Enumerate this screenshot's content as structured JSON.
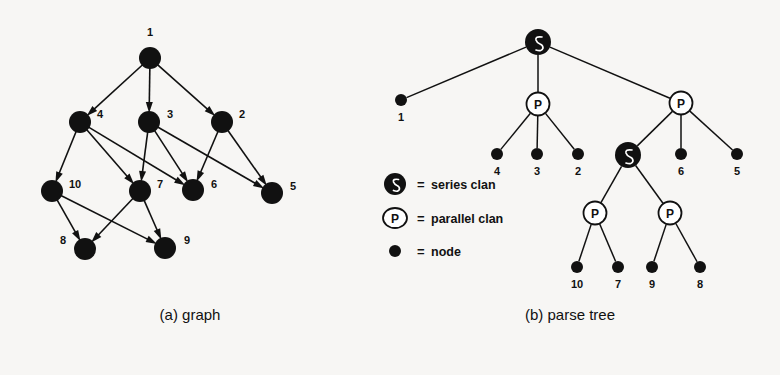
{
  "figure": {
    "background_color": "#f7f6f4",
    "ink_color": "#111111",
    "panels": [
      {
        "id": "a",
        "caption": "(a) graph"
      },
      {
        "id": "b",
        "caption": "(b) parse tree"
      }
    ]
  },
  "chart_data": {
    "type": "diagram",
    "panel_a": {
      "caption": "(a) graph",
      "kind": "directed-graph",
      "nodes": [
        {
          "id": "1",
          "label": "1",
          "x": 150,
          "y": 58,
          "label_x": 150,
          "label_y": 36,
          "label_anchor": "middle"
        },
        {
          "id": "4",
          "label": "4",
          "x": 80,
          "y": 122,
          "label_x": 97,
          "label_y": 118,
          "label_anchor": "start"
        },
        {
          "id": "3",
          "label": "3",
          "x": 149,
          "y": 122,
          "label_x": 167,
          "label_y": 118,
          "label_anchor": "start"
        },
        {
          "id": "2",
          "label": "2",
          "x": 222,
          "y": 122,
          "label_x": 239,
          "label_y": 118,
          "label_anchor": "start"
        },
        {
          "id": "10",
          "label": "10",
          "x": 52,
          "y": 191,
          "label_x": 69,
          "label_y": 188,
          "label_anchor": "start"
        },
        {
          "id": "7",
          "label": "7",
          "x": 140,
          "y": 191,
          "label_x": 157,
          "label_y": 188,
          "label_anchor": "start"
        },
        {
          "id": "6",
          "label": "6",
          "x": 193,
          "y": 190,
          "label_x": 211,
          "label_y": 188,
          "label_anchor": "start"
        },
        {
          "id": "5",
          "label": "5",
          "x": 272,
          "y": 193,
          "label_x": 290,
          "label_y": 190,
          "label_anchor": "start"
        },
        {
          "id": "8",
          "label": "8",
          "x": 85,
          "y": 249,
          "label_x": 66,
          "label_y": 244,
          "label_anchor": "end"
        },
        {
          "id": "9",
          "label": "9",
          "x": 165,
          "y": 248,
          "label_x": 184,
          "label_y": 244,
          "label_anchor": "start"
        }
      ],
      "edges": [
        {
          "from": "1",
          "to": "4"
        },
        {
          "from": "1",
          "to": "3"
        },
        {
          "from": "1",
          "to": "2"
        },
        {
          "from": "4",
          "to": "10"
        },
        {
          "from": "4",
          "to": "7"
        },
        {
          "from": "4",
          "to": "6"
        },
        {
          "from": "3",
          "to": "7"
        },
        {
          "from": "3",
          "to": "6"
        },
        {
          "from": "3",
          "to": "5"
        },
        {
          "from": "2",
          "to": "6"
        },
        {
          "from": "2",
          "to": "5"
        },
        {
          "from": "10",
          "to": "8"
        },
        {
          "from": "10",
          "to": "9"
        },
        {
          "from": "7",
          "to": "8"
        },
        {
          "from": "7",
          "to": "9"
        }
      ],
      "node_radius": 11,
      "directed": true
    },
    "panel_b": {
      "caption": "(b) parse tree",
      "kind": "tree",
      "nodes": [
        {
          "id": "root",
          "type": "series",
          "x": 538,
          "y": 42,
          "label": ""
        },
        {
          "id": "leaf1",
          "type": "node",
          "x": 401,
          "y": 100,
          "label": "1",
          "label_x": 401,
          "label_y": 121
        },
        {
          "id": "p1",
          "type": "parallel",
          "x": 538,
          "y": 104,
          "label": "P"
        },
        {
          "id": "p2",
          "type": "parallel",
          "x": 681,
          "y": 103,
          "label": "P"
        },
        {
          "id": "leaf4",
          "type": "node",
          "x": 497,
          "y": 154,
          "label": "4",
          "label_x": 497,
          "label_y": 175
        },
        {
          "id": "leaf3",
          "type": "node",
          "x": 537,
          "y": 154,
          "label": "3",
          "label_x": 537,
          "label_y": 175
        },
        {
          "id": "leaf2",
          "type": "node",
          "x": 578,
          "y": 154,
          "label": "2",
          "label_x": 578,
          "label_y": 175
        },
        {
          "id": "s2",
          "type": "series",
          "x": 628,
          "y": 155,
          "label": ""
        },
        {
          "id": "leaf6",
          "type": "node",
          "x": 681,
          "y": 154,
          "label": "6",
          "label_x": 681,
          "label_y": 175
        },
        {
          "id": "leaf5",
          "type": "node",
          "x": 737,
          "y": 154,
          "label": "5",
          "label_x": 737,
          "label_y": 175
        },
        {
          "id": "p3",
          "type": "parallel",
          "x": 595,
          "y": 213,
          "label": "P"
        },
        {
          "id": "p4",
          "type": "parallel",
          "x": 670,
          "y": 213,
          "label": "P"
        },
        {
          "id": "leaf10",
          "type": "node",
          "x": 577,
          "y": 267,
          "label": "10",
          "label_x": 577,
          "label_y": 288
        },
        {
          "id": "leaf7",
          "type": "node",
          "x": 618,
          "y": 267,
          "label": "7",
          "label_x": 618,
          "label_y": 288
        },
        {
          "id": "leaf9",
          "type": "node",
          "x": 652,
          "y": 267,
          "label": "9",
          "label_x": 652,
          "label_y": 288
        },
        {
          "id": "leaf8",
          "type": "node",
          "x": 700,
          "y": 267,
          "label": "8",
          "label_x": 700,
          "label_y": 288
        }
      ],
      "edges": [
        {
          "from": "root",
          "to": "leaf1"
        },
        {
          "from": "root",
          "to": "p1"
        },
        {
          "from": "root",
          "to": "p2"
        },
        {
          "from": "p1",
          "to": "leaf4"
        },
        {
          "from": "p1",
          "to": "leaf3"
        },
        {
          "from": "p1",
          "to": "leaf2"
        },
        {
          "from": "p2",
          "to": "s2"
        },
        {
          "from": "p2",
          "to": "leaf6"
        },
        {
          "from": "p2",
          "to": "leaf5"
        },
        {
          "from": "s2",
          "to": "p3"
        },
        {
          "from": "s2",
          "to": "p4"
        },
        {
          "from": "p3",
          "to": "leaf10"
        },
        {
          "from": "p3",
          "to": "leaf7"
        },
        {
          "from": "p4",
          "to": "leaf9"
        },
        {
          "from": "p4",
          "to": "leaf8"
        }
      ],
      "directed": false
    },
    "legend": {
      "x": 395,
      "items": [
        {
          "symbol": "series-clan-icon",
          "equals": "=",
          "label": "series clan",
          "y": 184
        },
        {
          "symbol": "parallel-clan-icon",
          "equals": "=",
          "label": "parallel clan",
          "y": 218
        },
        {
          "symbol": "node-icon",
          "equals": "=",
          "label": "node",
          "y": 251
        }
      ]
    }
  },
  "captions": {
    "panel_a": "(a) graph",
    "panel_a_x": 190,
    "panel_a_y": 320,
    "panel_b": "(b) parse tree",
    "panel_b_x": 570,
    "panel_b_y": 320
  }
}
